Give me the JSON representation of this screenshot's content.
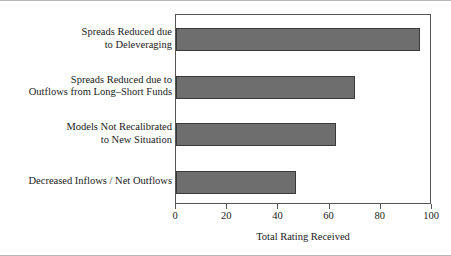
{
  "chart_data": {
    "type": "bar",
    "orientation": "horizontal",
    "title": "",
    "subtitle": "",
    "xlabel": "Total Rating Received",
    "ylabel": "",
    "categories": [
      "Spreads Reduced due\nto Deleveraging",
      "Spreads Reduced due to\nOutflows from Long–Short Funds",
      "Models Not Recalibrated\nto New Situation",
      "Decreased Inflows / Net Outflows"
    ],
    "values": [
      95.5,
      70,
      62.5,
      47
    ],
    "xlim": [
      0,
      100
    ],
    "xticks": [
      0,
      20,
      40,
      60,
      80,
      100
    ],
    "xtick_labels": [
      "0",
      "20",
      "40",
      "60",
      "80",
      "100"
    ],
    "grid": false,
    "legend": false,
    "bar_color": "#6e6e6e",
    "bar_edge_color": "#3a3a3a",
    "frame_color": "#555555",
    "background_color": "#ffffff",
    "text_color": "#1a1a1a"
  }
}
